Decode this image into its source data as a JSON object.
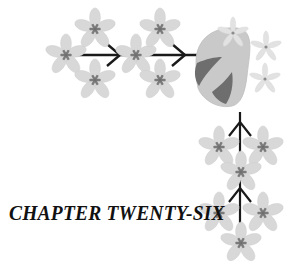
{
  "page": {
    "background_color": "#ffffff",
    "width": 295,
    "height": 264,
    "kind": "book-chapter-heading-ornament"
  },
  "heading": {
    "title": "CHAPTER TWENTY-SIX",
    "style": "italic-serif-smallcaps",
    "color": "#111111"
  },
  "palette": {
    "petal_light": "#d8d8d8",
    "petal_light_edge": "#cacaca",
    "petal_pale": "#e2e2e2",
    "flower_center": "#7b7b7b",
    "flower_center_small": "#8c8c8c",
    "bud_body": "#c9c9c9",
    "bud_shadow": "#6e6e6e",
    "stem": "#1a1a1a",
    "background": "#ffffff"
  },
  "ornament": {
    "description": "Floral vine with arrow-shaped stems, a large bud blossom and scattered small blossoms",
    "branches": [
      {
        "name": "horizontal-branch",
        "direction": "left-to-right",
        "arrow_count": 2
      },
      {
        "name": "vertical-branch",
        "direction": "bottom-to-top",
        "arrow_count": 2
      }
    ],
    "flowers_large": 11,
    "flowers_small": 3,
    "bud_count": 1
  }
}
